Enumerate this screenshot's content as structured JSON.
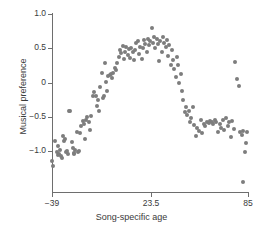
{
  "chart_data": {
    "type": "scatter",
    "title": "",
    "xlabel": "Song-specific age",
    "ylabel": "Musical preference",
    "xlim": [
      -39,
      85
    ],
    "ylim": [
      -1.2,
      1.05
    ],
    "xticks": [
      -39,
      23.5,
      85
    ],
    "xtick_labels": [
      "−39",
      "23.5",
      "85"
    ],
    "yticks": [
      1.0,
      0.5,
      0,
      -0.5,
      -1.0
    ],
    "ytick_labels": [
      "1.0",
      "0.5",
      "0",
      "−0.5",
      "−1.0"
    ],
    "grid": false,
    "legend": null,
    "marker_color": "#7d7d7d",
    "marker_size": 4,
    "points": [
      [
        -38.8,
        -1.15
      ],
      [
        -38.2,
        -1.22
      ],
      [
        -37.0,
        -0.86
      ],
      [
        -36.0,
        -1.01
      ],
      [
        -35.3,
        -0.93
      ],
      [
        -35.0,
        -1.06
      ],
      [
        -34.4,
        -1.05
      ],
      [
        -33.8,
        -0.98
      ],
      [
        -33.2,
        -1.07
      ],
      [
        -32.6,
        -1.1
      ],
      [
        -32.0,
        -0.78
      ],
      [
        -31.5,
        -0.86
      ],
      [
        -30.8,
        -0.83
      ],
      [
        -30.2,
        -1.02
      ],
      [
        -29.6,
        -1.0
      ],
      [
        -29.0,
        -1.05
      ],
      [
        -28.2,
        -0.41
      ],
      [
        -27.4,
        -0.41
      ],
      [
        -26.6,
        -0.87
      ],
      [
        -26.0,
        -0.95
      ],
      [
        -25.4,
        -1.03
      ],
      [
        -24.8,
        -1.05
      ],
      [
        -24.2,
        -0.99
      ],
      [
        -23.4,
        -0.72
      ],
      [
        -22.6,
        -1.02
      ],
      [
        -22.0,
        -1.0
      ],
      [
        -21.2,
        -0.74
      ],
      [
        -20.4,
        -0.64
      ],
      [
        -19.6,
        -0.56
      ],
      [
        -19.0,
        -0.61
      ],
      [
        -18.2,
        -0.82
      ],
      [
        -17.4,
        -0.55
      ],
      [
        -16.6,
        -0.51
      ],
      [
        -15.8,
        -0.58
      ],
      [
        -15.0,
        -0.7
      ],
      [
        -14.2,
        -0.49
      ],
      [
        -13.0,
        -0.19
      ],
      [
        -12.2,
        -0.14
      ],
      [
        -11.4,
        -0.2
      ],
      [
        -10.6,
        -0.34
      ],
      [
        -10.0,
        -0.26
      ],
      [
        -9.2,
        -0.41
      ],
      [
        -8.4,
        -0.06
      ],
      [
        -7.6,
        0.14
      ],
      [
        -7.0,
        -0.22
      ],
      [
        -6.4,
        -0.19
      ],
      [
        -5.6,
        0.28
      ],
      [
        -5.0,
        0.01
      ],
      [
        -4.2,
        -0.13
      ],
      [
        -3.4,
        0.09
      ],
      [
        -2.6,
        0.11
      ],
      [
        -2.0,
        0.12
      ],
      [
        -1.2,
        0.06
      ],
      [
        -0.4,
        0.14
      ],
      [
        0.6,
        0.21
      ],
      [
        1.4,
        0.18
      ],
      [
        2.4,
        0.29
      ],
      [
        3.2,
        0.37
      ],
      [
        4.0,
        0.47
      ],
      [
        4.8,
        0.43
      ],
      [
        5.6,
        0.54
      ],
      [
        6.4,
        0.34
      ],
      [
        7.2,
        0.45
      ],
      [
        8.0,
        0.52
      ],
      [
        8.8,
        0.4
      ],
      [
        9.6,
        0.49
      ],
      [
        10.4,
        0.36
      ],
      [
        11.2,
        0.51
      ],
      [
        12.0,
        0.44
      ],
      [
        12.8,
        0.33
      ],
      [
        13.6,
        0.47
      ],
      [
        14.4,
        0.58
      ],
      [
        15.2,
        0.61
      ],
      [
        16.0,
        0.42
      ],
      [
        16.8,
        0.52
      ],
      [
        17.6,
        0.35
      ],
      [
        18.4,
        0.5
      ],
      [
        19.2,
        0.62
      ],
      [
        20.0,
        0.57
      ],
      [
        20.8,
        0.45
      ],
      [
        21.6,
        0.64
      ],
      [
        22.4,
        0.55
      ],
      [
        23.2,
        0.6
      ],
      [
        24.0,
        0.79
      ],
      [
        24.8,
        0.58
      ],
      [
        25.6,
        0.66
      ],
      [
        26.4,
        0.5
      ],
      [
        27.2,
        0.63
      ],
      [
        28.0,
        0.56
      ],
      [
        28.8,
        0.31
      ],
      [
        29.6,
        0.61
      ],
      [
        30.4,
        0.44
      ],
      [
        31.2,
        0.66
      ],
      [
        32.0,
        0.58
      ],
      [
        32.8,
        0.52
      ],
      [
        33.6,
        0.62
      ],
      [
        34.4,
        0.39
      ],
      [
        35.2,
        0.55
      ],
      [
        36.0,
        0.26
      ],
      [
        36.8,
        0.47
      ],
      [
        37.6,
        0.33
      ],
      [
        38.4,
        0.2
      ],
      [
        39.2,
        0.08
      ],
      [
        40.0,
        0.38
      ],
      [
        40.8,
        0.25
      ],
      [
        41.6,
        -0.01
      ],
      [
        42.4,
        0.13
      ],
      [
        43.2,
        -0.13
      ],
      [
        44.0,
        -0.25
      ],
      [
        45.0,
        -0.43
      ],
      [
        45.8,
        -0.36
      ],
      [
        46.6,
        -0.47
      ],
      [
        47.4,
        -0.41
      ],
      [
        48.2,
        -0.58
      ],
      [
        49.0,
        -0.52
      ],
      [
        50.0,
        -0.35
      ],
      [
        51.0,
        -0.62
      ],
      [
        52.0,
        -0.78
      ],
      [
        53.0,
        -0.66
      ],
      [
        54.0,
        -0.71
      ],
      [
        55.0,
        -0.55
      ],
      [
        56.0,
        -0.74
      ],
      [
        57.0,
        -0.6
      ],
      [
        58.0,
        -0.63
      ],
      [
        59.0,
        -0.57
      ],
      [
        60.0,
        -0.59
      ],
      [
        61.0,
        -0.56
      ],
      [
        62.0,
        -0.58
      ],
      [
        63.0,
        -0.61
      ],
      [
        64.0,
        -0.54
      ],
      [
        65.0,
        -0.57
      ],
      [
        66.0,
        -0.72
      ],
      [
        67.0,
        -0.6
      ],
      [
        68.0,
        -0.66
      ],
      [
        69.0,
        -0.55
      ],
      [
        70.0,
        -0.7
      ],
      [
        71.0,
        -0.52
      ],
      [
        72.0,
        -0.63
      ],
      [
        73.0,
        -0.58
      ],
      [
        74.0,
        -0.8
      ],
      [
        75.0,
        -0.56
      ],
      [
        76.0,
        -0.68
      ],
      [
        77.0,
        0.3
      ],
      [
        78.0,
        0.05
      ],
      [
        79.0,
        -0.05
      ],
      [
        80.0,
        -0.72
      ],
      [
        81.0,
        -0.77
      ],
      [
        82.0,
        -0.71
      ],
      [
        83.0,
        -1.01
      ],
      [
        83.6,
        -0.88
      ],
      [
        84.2,
        -0.72
      ],
      [
        81.5,
        -1.45
      ]
    ]
  }
}
